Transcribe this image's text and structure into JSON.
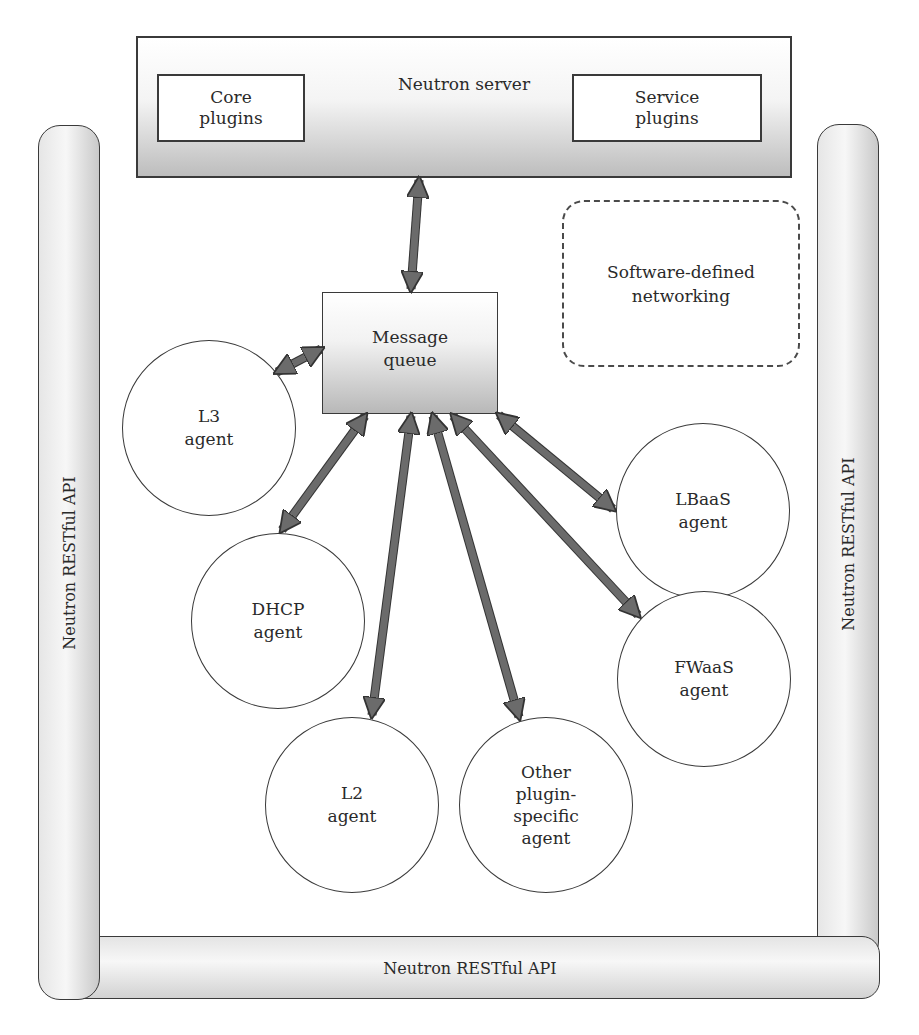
{
  "neutron_server": {
    "title": "Neutron server",
    "core_plugins": "Core\nplugins",
    "service_plugins": "Service\nplugins"
  },
  "restful_api": {
    "left_label": "Neutron RESTful API",
    "right_label": "Neutron RESTful API",
    "bottom_label": "Neutron RESTful API"
  },
  "message_queue": {
    "label": "Message\nqueue"
  },
  "sdn": {
    "label": "Software-defined\nnetworking"
  },
  "agents": [
    {
      "id": "l3",
      "label": "L3\nagent"
    },
    {
      "id": "dhcp",
      "label": "DHCP\nagent"
    },
    {
      "id": "l2",
      "label": "L2\nagent"
    },
    {
      "id": "other",
      "label": "Other\nplugin-\nspecific\nagent"
    },
    {
      "id": "lbaas",
      "label": "LBaaS\nagent"
    },
    {
      "id": "fwaas",
      "label": "FWaaS\nagent"
    }
  ],
  "colors": {
    "arrow_fill": "#6b6b6b",
    "arrow_stroke": "#333333",
    "outline": "#3a3a3a"
  }
}
